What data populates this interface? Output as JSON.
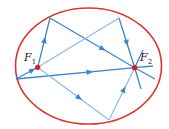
{
  "diagram": {
    "colors": {
      "ellipse": "#d63a2f",
      "ray": "#3f86c8",
      "ray_light": "#8fbde3",
      "focus": "#d0202a",
      "background": "#ffffff"
    },
    "ellipse": {
      "cx": 88.5,
      "cy": 66,
      "rx": 73,
      "ry": 58
    },
    "foci": [
      {
        "id": "F1",
        "label": "F",
        "subscript": "1",
        "x": 37.7,
        "y": 67.3,
        "label_x": 24,
        "label_y": 61
      },
      {
        "id": "F2",
        "label": "F",
        "subscript": "2",
        "x": 134.7,
        "y": 67.7,
        "label_x": 140,
        "label_y": 61
      }
    ],
    "rays": [
      {
        "name": "F1-to-top-left",
        "x1": 37.7,
        "y1": 67.3,
        "x2": 50,
        "y2": 18,
        "arrow_t": 0.55
      },
      {
        "name": "top-left-to-F2",
        "x1": 50,
        "y1": 18,
        "x2": 134.7,
        "y2": 67.7,
        "arrow_t": 0.62
      },
      {
        "name": "F1-to-top-right",
        "x1": 37.7,
        "y1": 67.3,
        "x2": 119,
        "y2": 18,
        "arrow_t": -1
      },
      {
        "name": "top-right-to-F2",
        "x1": 119,
        "y1": 18,
        "x2": 134.7,
        "y2": 67.7,
        "arrow_t": 0.5
      },
      {
        "name": "left-to-F1",
        "x1": 16,
        "y1": 79,
        "x2": 37.7,
        "y2": 67.3,
        "arrow_t": 0.75
      },
      {
        "name": "left-to-F2",
        "x1": 16,
        "y1": 79,
        "x2": 134.7,
        "y2": 67.7,
        "arrow_t": 0.62
      },
      {
        "name": "F1-to-bottom",
        "x1": 37.7,
        "y1": 67.3,
        "x2": 109,
        "y2": 120,
        "arrow_t": 0.58
      },
      {
        "name": "bottom-to-F2",
        "x1": 109,
        "y1": 120,
        "x2": 134.7,
        "y2": 67.7,
        "arrow_t": 0.58
      },
      {
        "name": "F2-ext-right",
        "x1": 134.7,
        "y1": 67.7,
        "x2": 153,
        "y2": 66,
        "arrow_t": -1
      },
      {
        "name": "F2-ext-down-right",
        "x1": 134.7,
        "y1": 67.7,
        "x2": 155,
        "y2": 79,
        "arrow_t": -1
      },
      {
        "name": "F2-ext-down",
        "x1": 134.7,
        "y1": 67.7,
        "x2": 141,
        "y2": 89,
        "arrow_t": -1
      },
      {
        "name": "F2-ext-up",
        "x1": 134.7,
        "y1": 67.7,
        "x2": 143,
        "y2": 50,
        "arrow_t": -1
      }
    ]
  }
}
